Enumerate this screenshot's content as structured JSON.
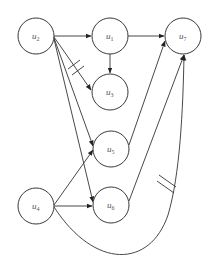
{
  "diagram": {
    "type": "directed-graph",
    "nodes": [
      {
        "id": "u2",
        "label": "u",
        "sub": "2",
        "x": 36,
        "y": 36
      },
      {
        "id": "u1",
        "label": "u",
        "sub": "1",
        "x": 110,
        "y": 36
      },
      {
        "id": "u7",
        "label": "u",
        "sub": "7",
        "x": 183,
        "y": 36
      },
      {
        "id": "u3",
        "label": "u",
        "sub": "3",
        "x": 110,
        "y": 92
      },
      {
        "id": "u5",
        "label": "u",
        "sub": "5",
        "x": 111,
        "y": 149
      },
      {
        "id": "u6",
        "label": "u",
        "sub": "6",
        "x": 111,
        "y": 205
      },
      {
        "id": "u4",
        "label": "u",
        "sub": "4",
        "x": 36,
        "y": 206
      }
    ],
    "node_radius": 18,
    "edges": [
      {
        "from": "u2",
        "to": "u1",
        "marked": false
      },
      {
        "from": "u1",
        "to": "u7",
        "marked": false
      },
      {
        "from": "u1",
        "to": "u3",
        "marked": false
      },
      {
        "from": "u2",
        "to": "u3",
        "marked": true
      },
      {
        "from": "u2",
        "to": "u5",
        "marked": false
      },
      {
        "from": "u2",
        "to": "u6",
        "marked": false
      },
      {
        "from": "u4",
        "to": "u5",
        "marked": false
      },
      {
        "from": "u4",
        "to": "u6",
        "marked": false
      },
      {
        "from": "u5",
        "to": "u7",
        "marked": false
      },
      {
        "from": "u6",
        "to": "u7",
        "marked": false
      },
      {
        "from": "u4",
        "to": "u7",
        "marked": true,
        "curved": true
      }
    ],
    "colors": {
      "stroke": "#333333",
      "label": "#555555",
      "background": "#ffffff"
    }
  }
}
